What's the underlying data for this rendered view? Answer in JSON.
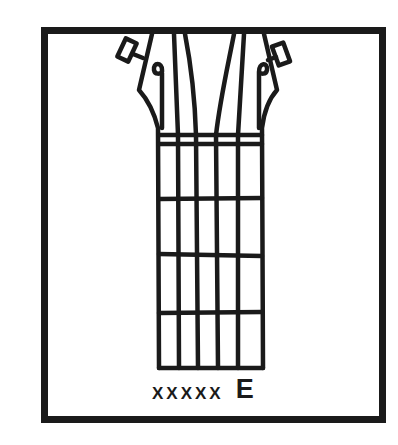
{
  "diagram": {
    "title": "E",
    "instrument": "guitar-headstock-and-neck",
    "string_markers": "XXXXX",
    "string_marker_list": [
      "X",
      "X",
      "X",
      "X",
      "X",
      ""
    ],
    "chord_name": "E",
    "colors": {
      "ink": "#1a1a1a",
      "background": "#ffffff"
    },
    "fret_count": 4
  }
}
